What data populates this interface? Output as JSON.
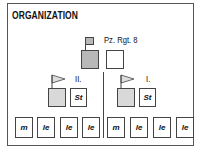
{
  "title": "ORGANIZATION",
  "regiment": {
    "label": "Pz. Rgt. 8"
  },
  "battalions": [
    {
      "label": "II.",
      "staff_label": "St",
      "companies": [
        "m",
        "le",
        "le",
        "le"
      ]
    },
    {
      "label": "I.",
      "staff_label": "St",
      "companies": [
        "m",
        "le",
        "le",
        "le"
      ]
    }
  ],
  "colors": {
    "regiment_fill": "#b8b8b8",
    "battalion_fill": "#d9d9d9",
    "border": "#444444"
  }
}
